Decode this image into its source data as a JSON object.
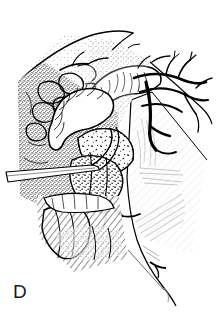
{
  "figure": {
    "label": "D",
    "caption_text": "",
    "panel_letter": "D",
    "medium": "pen-and-ink line drawing with stipple shading",
    "colors": {
      "background": "#ffffff",
      "ink": "#000000",
      "label_ink": "#1a1a1a",
      "mid_tone": "#555555",
      "light_tone": "#9a9a9a",
      "faint_tone": "#c8c8c8"
    },
    "canvas": {
      "width": 219,
      "height": 317
    }
  },
  "illustration": {
    "title": "",
    "annotations": [],
    "leader_lines": [],
    "regions": [
      {
        "name": "upper-fascial-sheet",
        "description": "broad curving sheet of tissue sweeping from upper left down to upper right with fine stipple",
        "tone": "light"
      },
      {
        "name": "stippled-tissue-field",
        "description": "dense stippled retroperitoneal fat and connective tissue filling the left and central field",
        "tone": "mid"
      },
      {
        "name": "tubular-structure-upper",
        "description": "large pale tubular viscus with transverse striations curving from center to upper right",
        "tone": "light"
      },
      {
        "name": "tubular-structure-lower",
        "description": "second pale tubular loop descending toward the left-center",
        "tone": "light"
      },
      {
        "name": "nodular-mass",
        "description": "irregular pale nodular mass with speckled surface at the center of the field",
        "tone": "light"
      },
      {
        "name": "lobulated-tissue-mass",
        "description": "dark lobulated glandular tissue below and right of the nodular mass",
        "tone": "dark"
      },
      {
        "name": "vascular-tree-right",
        "description": "branching arterial and venous network spreading across the upper right quadrant",
        "tone": "dark"
      },
      {
        "name": "retracted-peritoneal-flap",
        "description": "large pale retracted membranous flap occupying the right side with faint hatch shading",
        "tone": "faint"
      },
      {
        "name": "retractor-instrument",
        "description": "slender straight instrument entering horizontally from the left margin",
        "tone": "outline"
      },
      {
        "name": "vessel-loop-clamp",
        "description": "small oval vessel loop or clamp on a vessel in the lower central field",
        "tone": "dark"
      },
      {
        "name": "elongated-hatched-structure",
        "description": "elongated obliquely hatched structure in the lower left, heavily line-shaded",
        "tone": "dark"
      },
      {
        "name": "lower-incised-edge",
        "description": "long curving incised tissue edge descending to the lower right corner",
        "tone": "outline"
      }
    ]
  }
}
